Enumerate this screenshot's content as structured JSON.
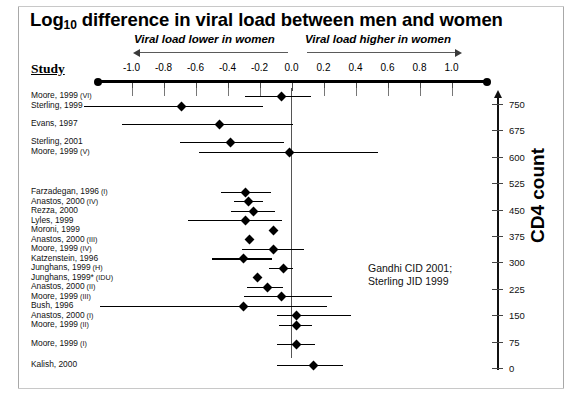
{
  "chart_data": {
    "type": "scatter",
    "title": "Log10 difference in viral load between men and women",
    "title_main": "Log",
    "title_sub": "10",
    "title_rest": " difference in viral load between men and women",
    "xlabel": "",
    "ylabel": "Study",
    "xlim": [
      -1.2,
      1.2
    ],
    "xticks": [
      -1.0,
      -0.8,
      -0.6,
      -0.4,
      -0.2,
      0.0,
      0.2,
      0.4,
      0.6,
      0.8,
      1.0
    ],
    "xtick_labels": [
      "-1.0",
      "-0.8",
      "-0.6",
      "-0.4",
      "-0.2",
      "0.0",
      "0.2",
      "0.4",
      "0.6",
      "0.8",
      "1.0"
    ],
    "direction_left": "Viral load lower in women",
    "direction_right": "Viral load higher in women",
    "study_header": "Study",
    "zero_reference": 0.0,
    "grid": false,
    "legend": "none",
    "secondary_axis": {
      "label": "CD4 count",
      "ticks": [
        0,
        75,
        150,
        225,
        300,
        375,
        450,
        525,
        600,
        675,
        750
      ],
      "tick_labels": [
        "0",
        "75",
        "150",
        "225",
        "300",
        "375",
        "450",
        "525",
        "600",
        "675",
        "750"
      ],
      "ylim": [
        0,
        750
      ],
      "position": "right"
    },
    "annotation": {
      "line1": "Gandhi CID 2001;",
      "line2": "Sterling JID 1999"
    },
    "studies": [
      {
        "label": "Moore, 1999",
        "roman": "(VI)",
        "estimate": -0.06,
        "ci_low": -0.29,
        "ci_high": 0.12,
        "row": 0
      },
      {
        "label": "Sterling, 1999",
        "roman": "",
        "estimate": -0.69,
        "ci_low": -1.3,
        "ci_high": -0.18,
        "row": 1
      },
      {
        "label": "Evans, 1997",
        "roman": "",
        "estimate": -0.45,
        "ci_low": -1.06,
        "ci_high": 0.01,
        "row": 2
      },
      {
        "label": "Sterling, 2001",
        "roman": "",
        "estimate": -0.38,
        "ci_low": -0.7,
        "ci_high": -0.05,
        "row": 3
      },
      {
        "label": "Moore, 1999",
        "roman": "(V)",
        "estimate": -0.01,
        "ci_low": -0.58,
        "ci_high": 0.54,
        "row": 4
      },
      {
        "label": "Farzadegan, 1996",
        "roman": "(I)",
        "estimate": -0.29,
        "ci_low": -0.44,
        "ci_high": -0.13,
        "row": 5
      },
      {
        "label": "Anastos, 2000",
        "roman": "(IV)",
        "estimate": -0.27,
        "ci_low": -0.36,
        "ci_high": -0.18,
        "row": 6
      },
      {
        "label": "Rezza, 2000",
        "roman": "",
        "estimate": -0.24,
        "ci_low": -0.38,
        "ci_high": -0.1,
        "row": 7
      },
      {
        "label": "Lyles, 1999",
        "roman": "",
        "estimate": -0.29,
        "ci_low": -0.65,
        "ci_high": -0.06,
        "row": 8
      },
      {
        "label": "Moroni, 1999",
        "roman": "",
        "estimate": -0.11,
        "ci_low": -0.11,
        "ci_high": -0.11,
        "row": 9
      },
      {
        "label": "Anastos, 2000",
        "roman": "(III)",
        "estimate": -0.26,
        "ci_low": -0.26,
        "ci_high": -0.26,
        "row": 10
      },
      {
        "label": "Moore, 1999",
        "roman": "(IV)",
        "estimate": -0.11,
        "ci_low": -0.31,
        "ci_high": 0.08,
        "row": 11
      },
      {
        "label": "Katzenstein, 1996",
        "roman": "",
        "estimate": -0.3,
        "ci_low": -0.5,
        "ci_high": -0.12,
        "row": 12
      },
      {
        "label": "Junghans, 1999",
        "roman": "(H)",
        "estimate": -0.05,
        "ci_low": -0.14,
        "ci_high": 0.01,
        "row": 13
      },
      {
        "label": "Junghans, 1999*",
        "roman": "(IDU)",
        "estimate": -0.21,
        "ci_low": -0.21,
        "ci_high": -0.21,
        "row": 14
      },
      {
        "label": "Anastos, 2000",
        "roman": "(II)",
        "estimate": -0.15,
        "ci_low": -0.28,
        "ci_high": -0.05,
        "row": 15
      },
      {
        "label": "Moore, 1999",
        "roman": "(III)",
        "estimate": -0.06,
        "ci_low": -0.3,
        "ci_high": 0.25,
        "row": 16
      },
      {
        "label": "Bush, 1996",
        "roman": "",
        "estimate": -0.3,
        "ci_low": -1.2,
        "ci_high": 0.22,
        "row": 17
      },
      {
        "label": "Anastos, 2000",
        "roman": "(I)",
        "estimate": 0.03,
        "ci_low": -0.09,
        "ci_high": 0.37,
        "row": 18
      },
      {
        "label": "Moore, 1999",
        "roman": "(II)",
        "estimate": 0.03,
        "ci_low": -0.08,
        "ci_high": 0.13,
        "row": 19
      },
      {
        "label": "Moore, 1999",
        "roman": "(I)",
        "estimate": 0.03,
        "ci_low": -0.09,
        "ci_high": 0.15,
        "row": 20
      },
      {
        "label": "Kalish, 2000",
        "roman": "",
        "estimate": 0.14,
        "ci_low": -0.09,
        "ci_high": 0.32,
        "row": 21
      }
    ]
  }
}
